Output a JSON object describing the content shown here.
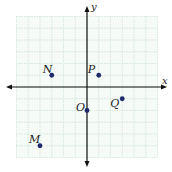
{
  "diagram": {
    "type": "coordinate-plane",
    "grid": {
      "x_min": -6,
      "x_max": 6,
      "y_min": -6,
      "y_max": 6,
      "unit_px": 11.75,
      "origin_px": [
        87,
        87
      ]
    },
    "axes": {
      "x_label": "x",
      "y_label": "y"
    },
    "colors": {
      "grid": "#cfe3d6",
      "axis": "#111111",
      "point": "#1f2a6b",
      "background": "#f6fbf8"
    },
    "points": [
      {
        "label": "N",
        "x": -3,
        "y": 1,
        "label_dx": -9,
        "label_dy": -2
      },
      {
        "label": "P",
        "x": 1,
        "y": 1,
        "label_dx": -11,
        "label_dy": -2
      },
      {
        "label": "O",
        "x": 0,
        "y": -2,
        "label_dx": -11,
        "label_dy": 0
      },
      {
        "label": "Q",
        "x": 3,
        "y": -1,
        "label_dx": -12,
        "label_dy": 8
      },
      {
        "label": "M",
        "x": -4,
        "y": -5,
        "label_dx": -11,
        "label_dy": -3
      }
    ]
  }
}
